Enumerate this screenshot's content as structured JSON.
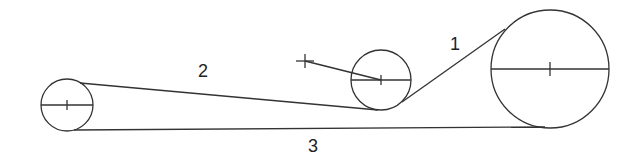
{
  "diagram": {
    "type": "belt-and-pulley",
    "stroke_color": "#333333",
    "labels": {
      "belt_1": "1",
      "belt_2": "2",
      "belt_3": "3"
    },
    "pulleys": [
      {
        "name": "small-left-pulley",
        "cx": 67,
        "cy": 105,
        "r": 26
      },
      {
        "name": "middle-idler-pulley",
        "cx": 381,
        "cy": 80,
        "r": 30
      },
      {
        "name": "large-right-pulley",
        "cx": 550,
        "cy": 69,
        "r": 59
      }
    ],
    "pivot_point": {
      "x": 305,
      "y": 61
    }
  }
}
